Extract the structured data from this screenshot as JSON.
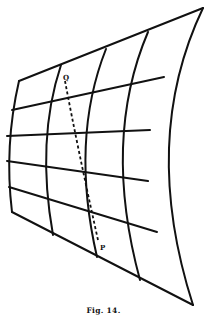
{
  "figure": {
    "caption": "Fig. 14.",
    "stroke_color": "#111111",
    "background": "#ffffff",
    "points": {
      "Q": {
        "label": "Q",
        "x": 66,
        "y": 78
      },
      "P": {
        "label": "P",
        "x": 100,
        "y": 248
      }
    },
    "grid": {
      "boundary": {
        "top": "M19,81 L203,8",
        "left": "M19,81 Q4,146 12,212",
        "bottom": "M12,212 L193,305",
        "right": "M203,8 Q140,140 193,305"
      },
      "parametric_lines_u": [
        "M12,110 L164,77",
        "M7,136 L150,130",
        "M7,161 L148,181",
        "M9,187 L157,232"
      ],
      "parametric_lines_v": [
        "M61,65 Q36,140 53,235",
        "M106,49 Q70,140 97,257",
        "M148,32 Q102,140 140,280"
      ],
      "geodesic": "M65,81 Q78,150 98,240"
    }
  }
}
